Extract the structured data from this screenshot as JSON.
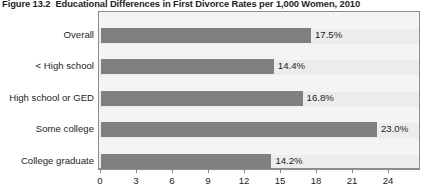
{
  "figure": {
    "number": "Figure 13.2",
    "title": "Educational Differences in First Divorce Rates per 1,000 Women, 2010"
  },
  "chart_data": {
    "type": "bar",
    "orientation": "horizontal",
    "xlabel": "",
    "ylabel": "",
    "categories": [
      "Overall",
      "< High school",
      "High school or GED",
      "Some college",
      "College graduate"
    ],
    "values": [
      17.5,
      14.4,
      16.8,
      23.0,
      14.2
    ],
    "value_labels": [
      "17.5%",
      "14.4%",
      "16.8%",
      "23.0%",
      "14.2%"
    ],
    "xlim": [
      0,
      26.8
    ],
    "xticks": [
      0,
      3,
      6,
      9,
      12,
      15,
      18,
      21,
      24
    ],
    "xtick_labels": [
      "0",
      "3",
      "6",
      "9",
      "12",
      "15",
      "18",
      "21",
      "24"
    ],
    "grid": false,
    "legend": false,
    "bar_color": "#808080",
    "plot_background": "#ececec",
    "band_color": "#f4f4f4"
  }
}
